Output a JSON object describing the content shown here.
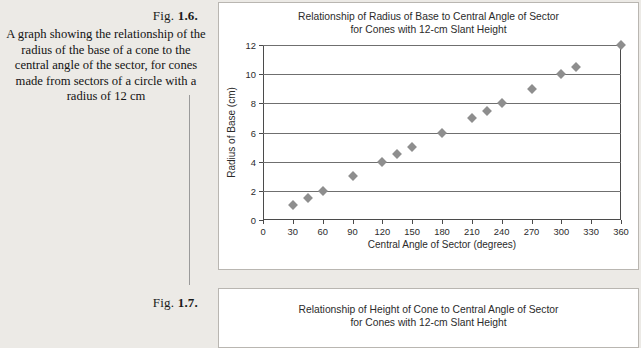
{
  "figure1": {
    "label_prefix": "Fig. ",
    "label_number": "1.6.",
    "caption": "A graph showing the relationship of the radius of the base of a cone to the central angle of the sector, for cones made from sectors of a circle with a radius of 12 cm"
  },
  "figure2": {
    "label_prefix": "Fig. ",
    "label_number": "1.7.",
    "title_line1": "Relationship of Height of Cone to Central Angle of Sector",
    "title_line2": "for Cones with 12-cm Slant Height"
  },
  "colors": {
    "page_background": "#eceae6",
    "panel_background": "#ffffff",
    "marker": "#8e8e8e",
    "gridline": "#6f6f6f",
    "axis": "#4b4b4b"
  },
  "chart_data": {
    "type": "scatter",
    "title": "Relationship of Radius of Base to Central Angle of Sector for Cones with 12-cm Slant Height",
    "title_line1": "Relationship of Radius of Base to Central Angle of Sector",
    "title_line2": "for Cones with 12-cm Slant Height",
    "xlabel": "Central Angle of Sector (degrees)",
    "ylabel": "Radius of Base (cm)",
    "xlim": [
      0,
      360
    ],
    "ylim": [
      0,
      12
    ],
    "xticks": [
      0,
      30,
      60,
      90,
      120,
      150,
      180,
      210,
      240,
      270,
      300,
      330,
      360
    ],
    "yticks": [
      0,
      2,
      4,
      6,
      8,
      10,
      12
    ],
    "xtick_labels": [
      "0",
      "30",
      "60",
      "90",
      "120",
      "150",
      "180",
      "210",
      "240",
      "270",
      "300",
      "330",
      "360"
    ],
    "ytick_labels": [
      "0",
      "2",
      "4",
      "6",
      "8",
      "10",
      "12"
    ],
    "grid": "horizontal",
    "legend": "none",
    "marker_style": "diamond",
    "series": [
      {
        "name": "Radius of Base",
        "points": [
          [
            30,
            1.0
          ],
          [
            45,
            1.5
          ],
          [
            60,
            2.0
          ],
          [
            90,
            3.0
          ],
          [
            120,
            4.0
          ],
          [
            135,
            4.5
          ],
          [
            150,
            5.0
          ],
          [
            180,
            6.0
          ],
          [
            210,
            7.0
          ],
          [
            225,
            7.5
          ],
          [
            240,
            8.0
          ],
          [
            270,
            9.0
          ],
          [
            300,
            10.0
          ],
          [
            315,
            10.5
          ],
          [
            360,
            12.0
          ]
        ]
      }
    ]
  }
}
